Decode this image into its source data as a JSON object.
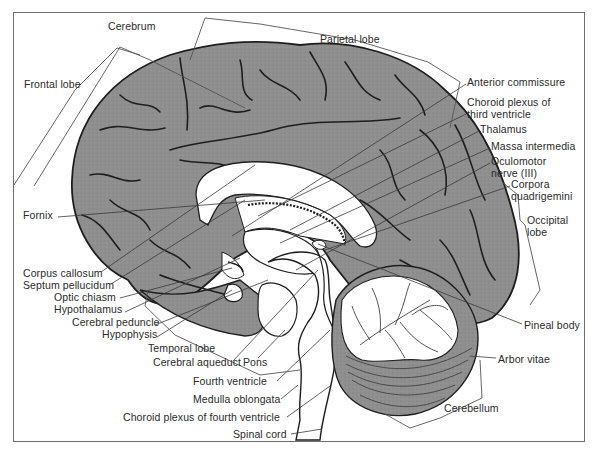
{
  "figure": {
    "colors": {
      "cortex": "#8f8f8f",
      "cortex_dark": "#6f6f6f",
      "sulcus": "#1e1e1e",
      "white_matter": "#ffffff",
      "line": "#3a3a3a",
      "frame": "#6e6e6e",
      "text": "#2a2a2a"
    },
    "frame": {
      "x": 13,
      "y": 12,
      "width": 572,
      "height": 430
    }
  },
  "labels": [
    {
      "id": "cerebrum",
      "text": "Cerebrum",
      "x": 108,
      "y": 22,
      "align": "left",
      "leader": null
    },
    {
      "id": "parietal-lobe",
      "text": "Parietal lobe",
      "x": 320,
      "y": 35,
      "align": "left",
      "leader": null
    },
    {
      "id": "frontal-lobe",
      "text": "Frontal lobe",
      "x": 24,
      "y": 80,
      "align": "left",
      "leader": null
    },
    {
      "id": "anterior-commissure",
      "text": "Anterior commissure",
      "x": 467,
      "y": 78,
      "align": "left",
      "leader": [
        466,
        84,
        232,
        236
      ]
    },
    {
      "id": "choroid-plexus-third-ventricle",
      "text": "Choroid plexus of",
      "text2": "third ventricle",
      "x": 467,
      "y": 98,
      "align": "left",
      "leader": [
        466,
        114,
        258,
        216
      ]
    },
    {
      "id": "thalamus",
      "text": "Thalamus",
      "x": 480,
      "y": 125,
      "align": "left",
      "leader": [
        479,
        131,
        290,
        230
      ]
    },
    {
      "id": "massa-intermedia",
      "text": "Massa intermedia",
      "x": 491,
      "y": 142,
      "align": "left",
      "leader": [
        490,
        148,
        280,
        243
      ]
    },
    {
      "id": "oculomotor-nerve",
      "text": "Oculomotor",
      "text2": "nerve (III)",
      "x": 491,
      "y": 157,
      "align": "left",
      "leader": [
        490,
        163,
        296,
        270
      ]
    },
    {
      "id": "corpora-quadrigemini",
      "text": "Corpora",
      "text2": "quadrigemini",
      "x": 511,
      "y": 180,
      "align": "left",
      "leader": [
        510,
        186,
        325,
        250
      ]
    },
    {
      "id": "occipital-lobe",
      "text": "Occipital",
      "text2": "lobe",
      "x": 527,
      "y": 216,
      "align": "left",
      "leader": null
    },
    {
      "id": "fornix",
      "text": "Fornix",
      "x": 23,
      "y": 211,
      "align": "left",
      "leader": [
        58,
        217,
        265,
        200
      ]
    },
    {
      "id": "corpus-callosum",
      "text": "Corpus callosum",
      "x": 23,
      "y": 269,
      "align": "left",
      "leader": [
        101,
        272,
        255,
        165
      ]
    },
    {
      "id": "septum-pellucidum",
      "text": "Septum pellucidum",
      "x": 23,
      "y": 281,
      "align": "left",
      "leader": [
        111,
        284,
        245,
        200
      ]
    },
    {
      "id": "optic-chiasm",
      "text": "Optic chiasm",
      "x": 54,
      "y": 293,
      "align": "left",
      "leader": [
        120,
        298,
        232,
        268
      ]
    },
    {
      "id": "hypothalamus",
      "text": "Hypothalamus",
      "x": 54,
      "y": 305,
      "align": "left",
      "leader": [
        125,
        312,
        240,
        258
      ]
    },
    {
      "id": "cerebral-peduncle",
      "text": "Cerebral peduncle",
      "x": 72,
      "y": 318,
      "align": "left",
      "leader": [
        155,
        325,
        268,
        280
      ]
    },
    {
      "id": "hypophysis",
      "text": "Hypophysis",
      "x": 102,
      "y": 330,
      "align": "left",
      "leader": [
        157,
        337,
        232,
        290
      ]
    },
    {
      "id": "temporal-lobe",
      "text": "Temporal lobe",
      "x": 148,
      "y": 344,
      "align": "left",
      "leader": null
    },
    {
      "id": "cerebral-aqueduct",
      "text": "Cerebral aqueduct",
      "x": 153,
      "y": 358,
      "align": "left",
      "leader": [
        233,
        361,
        318,
        270
      ]
    },
    {
      "id": "pons",
      "text": "Pons",
      "x": 243,
      "y": 358,
      "align": "left",
      "leader": [
        258,
        358,
        285,
        330
      ]
    },
    {
      "id": "fourth-ventricle",
      "text": "Fourth ventricle",
      "x": 193,
      "y": 377,
      "align": "left",
      "leader": [
        277,
        381,
        330,
        330
      ]
    },
    {
      "id": "medulla-oblongata",
      "text": "Medulla oblongata",
      "x": 193,
      "y": 395,
      "align": "left",
      "leader": [
        281,
        399,
        298,
        385
      ]
    },
    {
      "id": "choroid-plexus-fourth-ventricle",
      "text": "Choroid plexus of fourth ventricle",
      "x": 123,
      "y": 413,
      "align": "left",
      "leader": [
        287,
        417,
        330,
        386
      ]
    },
    {
      "id": "spinal-cord",
      "text": "Spinal cord",
      "x": 233,
      "y": 430,
      "align": "left",
      "leader": [
        291,
        434,
        322,
        429
      ]
    },
    {
      "id": "pineal-body",
      "text": "Pineal body",
      "x": 524,
      "y": 321,
      "align": "left",
      "leader": [
        522,
        324,
        318,
        244
      ]
    },
    {
      "id": "arbor-vitae",
      "text": "Arbor vitae",
      "x": 498,
      "y": 355,
      "align": "left",
      "leader": [
        496,
        358,
        470,
        356
      ]
    },
    {
      "id": "cerebellum",
      "text": "Cerebellum",
      "x": 444,
      "y": 404,
      "align": "left",
      "leader": null
    }
  ],
  "brackets": [
    {
      "for": "cerebrum",
      "points": "34,186 120,47 150,60 245,108"
    },
    {
      "for": "parietal-lobe",
      "points": "190,60 205,18 260,24 355,40 428,62 460,82 450,128"
    },
    {
      "for": "frontal-lobe",
      "points": "14,185 75,90 117,48 140,55"
    },
    {
      "for": "occipital-lobe",
      "points": "502,182 518,195 520,220 525,225 540,290 530,305"
    },
    {
      "for": "temporal-lobe",
      "points": "148,290 145,306 175,335 260,375 300,370"
    },
    {
      "for": "cerebellum",
      "points": "385,414 410,428 440,418 482,398 480,360"
    }
  ]
}
